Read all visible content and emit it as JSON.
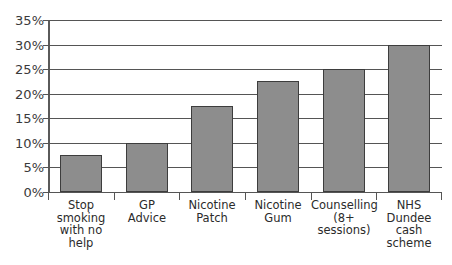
{
  "title_partial": "· · ·  ·   · ·",
  "colors": {
    "bar_fill": "#8d8d8d",
    "bar_border": "#3d3d3d",
    "gridline": "#555555",
    "axis": "#5a5a5a",
    "text": "#2b2b2b",
    "background": "#ffffff"
  },
  "chart_data": {
    "type": "bar",
    "title": "",
    "xlabel": "",
    "ylabel": "",
    "ylim": [
      0,
      35
    ],
    "ytick_labels": [
      "35%",
      "30%",
      "25%",
      "20%",
      "15%",
      "10%",
      "5%",
      "0%"
    ],
    "ytick_values": [
      35,
      30,
      25,
      20,
      15,
      10,
      5,
      0
    ],
    "grid": true,
    "legend": false,
    "categories": [
      "Stop smoking with no help",
      "GP Advice",
      "Nicotine Patch",
      "Nicotine Gum",
      "Counselling (8+ sessions)",
      "NHS Dundee cash scheme"
    ],
    "category_lines": [
      [
        "Stop",
        "smoking",
        "with no",
        "help"
      ],
      [
        "GP",
        "Advice"
      ],
      [
        "Nicotine",
        "Patch"
      ],
      [
        "Nicotine",
        "Gum"
      ],
      [
        "Counselling",
        "(8+",
        "sessions)"
      ],
      [
        "NHS",
        "Dundee",
        "cash",
        "scheme"
      ]
    ],
    "values": [
      7.5,
      10,
      17.5,
      22.5,
      25,
      30
    ],
    "value_labels": [
      "7.5%",
      "10%",
      "17.5%",
      "22.5%",
      "25%",
      "30%"
    ]
  }
}
